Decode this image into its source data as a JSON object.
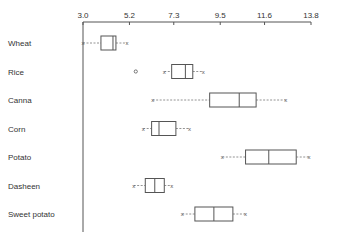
{
  "chart_data": {
    "type": "boxplot",
    "title": "",
    "xlabel": "",
    "ylabel": "",
    "orientation": "horizontal",
    "axis_position": "top",
    "xlim": [
      3.0,
      13.8
    ],
    "ticks": [
      3.0,
      5.2,
      7.3,
      9.5,
      11.6,
      13.8
    ],
    "tick_labels": [
      "3.0",
      "5.2",
      "7.3",
      "9.5",
      "11.6",
      "13.8"
    ],
    "grid": false,
    "legend": "none",
    "whisker_cap_glyph": "x",
    "outlier_glyph": "o",
    "categories": [
      "Wheat",
      "Rice",
      "Canna",
      "Corn",
      "Potato",
      "Dasheen",
      "Sweet potato"
    ],
    "series": [
      {
        "name": "Wheat",
        "whisker_low": 3.0,
        "q1": 3.85,
        "median": 4.42,
        "q3": 4.56,
        "whisker_high": 5.08,
        "outliers": []
      },
      {
        "name": "Rice",
        "whisker_low": 6.85,
        "q1": 7.2,
        "median": 7.85,
        "q3": 8.2,
        "whisker_high": 8.7,
        "outliers": [
          5.5
        ]
      },
      {
        "name": "Canna",
        "whisker_low": 6.3,
        "q1": 9.0,
        "median": 10.4,
        "q3": 11.2,
        "whisker_high": 12.6,
        "outliers": []
      },
      {
        "name": "Corn",
        "whisker_low": 5.85,
        "q1": 6.25,
        "median": 6.6,
        "q3": 7.4,
        "whisker_high": 8.05,
        "outliers": []
      },
      {
        "name": "Potato",
        "whisker_low": 9.6,
        "q1": 10.7,
        "median": 11.8,
        "q3": 13.1,
        "whisker_high": 13.7,
        "outliers": []
      },
      {
        "name": "Dasheen",
        "whisker_low": 5.4,
        "q1": 5.95,
        "median": 6.4,
        "q3": 6.85,
        "whisker_high": 7.2,
        "outliers": []
      },
      {
        "name": "Sweet potato",
        "whisker_low": 7.7,
        "q1": 8.3,
        "median": 9.2,
        "q3": 10.1,
        "whisker_high": 10.7,
        "outliers": []
      }
    ]
  }
}
